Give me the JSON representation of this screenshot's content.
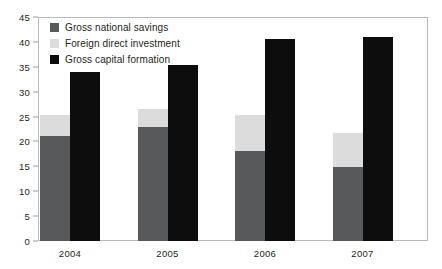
{
  "chart_data": {
    "type": "bar",
    "title": "",
    "subtitle": "",
    "xlabel": "",
    "ylabel": "",
    "categories": [
      "2004",
      "2005",
      "2006",
      "2007"
    ],
    "ylim": [
      0,
      45
    ],
    "yticks": [
      0,
      5,
      10,
      15,
      20,
      25,
      30,
      35,
      40,
      45
    ],
    "grid": false,
    "legend_position": "top-left",
    "stacking": "first-two-series-stacked",
    "series": [
      {
        "name": "Gross national savings",
        "color": "#58595b",
        "values": [
          21.0,
          23.0,
          18.0,
          14.8
        ]
      },
      {
        "name": "Foreign direct investment",
        "color": "#dcdcdc",
        "values": [
          4.4,
          3.5,
          7.3,
          7.0
        ]
      },
      {
        "name": "Gross capital formation",
        "color": "#0d0d0d",
        "values": [
          34.0,
          35.3,
          40.5,
          41.0
        ]
      }
    ],
    "stacked_totals": [
      25.4,
      26.5,
      25.3,
      21.8
    ]
  },
  "legend": {
    "items": [
      {
        "label": "Gross national savings",
        "swatch": "#58595b"
      },
      {
        "label": "Foreign direct investment",
        "swatch": "#dcdcdc"
      },
      {
        "label": "Gross capital formation",
        "swatch": "#0d0d0d"
      }
    ]
  },
  "axis": {
    "y_tick_labels": [
      "45",
      "40",
      "35",
      "30",
      "25",
      "20",
      "15",
      "10",
      "5",
      "0"
    ],
    "x_tick_labels": [
      "2004",
      "2005",
      "2006",
      "2007"
    ]
  }
}
